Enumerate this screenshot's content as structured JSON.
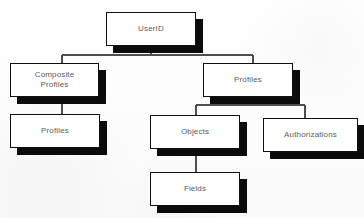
{
  "diagram": {
    "type": "tree",
    "background_color": "#fdfdfd",
    "box_fill_color": "#ffffff",
    "box_border_color": "#101010",
    "shadow_color": "#0b0b0b",
    "connector_color": "#4e4e4e",
    "label_color": "#5a5a5a",
    "nodes": [
      {
        "id": "userid",
        "label": "UserID",
        "x": 106,
        "y": 12,
        "w": 90,
        "h": 34,
        "shadow_dx": 7,
        "shadow_dy": 7
      },
      {
        "id": "composite-profiles",
        "label": "Composite\nProfiles",
        "x": 10,
        "y": 63,
        "w": 89,
        "h": 34,
        "shadow_dx": 7,
        "shadow_dy": 7
      },
      {
        "id": "profiles-left",
        "label": "Profiles",
        "x": 10,
        "y": 114,
        "w": 90,
        "h": 34,
        "shadow_dx": 7,
        "shadow_dy": 7
      },
      {
        "id": "profiles-right",
        "label": "Profiles",
        "x": 203,
        "y": 63,
        "w": 90,
        "h": 34,
        "shadow_dx": 7,
        "shadow_dy": 7
      },
      {
        "id": "objects",
        "label": "Objects",
        "x": 150,
        "y": 115,
        "w": 90,
        "h": 34,
        "shadow_dx": 7,
        "shadow_dy": 7
      },
      {
        "id": "authorizations",
        "label": "Authorizations",
        "x": 263,
        "y": 118,
        "w": 95,
        "h": 34,
        "shadow_dx": 7,
        "shadow_dy": 7
      },
      {
        "id": "fields",
        "label": "Fields",
        "x": 150,
        "y": 172,
        "w": 90,
        "h": 34,
        "shadow_dx": 7,
        "shadow_dy": 7
      }
    ],
    "edges": [
      {
        "id": "userid-stem",
        "from": "userid",
        "to": "bus-1",
        "x1": 151,
        "y1": 46,
        "x2": 151,
        "y2": 55
      },
      {
        "id": "bus-1",
        "from": "userid",
        "to": "children",
        "x1": 62,
        "y1": 55,
        "x2": 253,
        "y2": 55
      },
      {
        "id": "bus-1-left-drop",
        "from": "bus-1",
        "to": "composite-profiles",
        "x1": 62,
        "y1": 55,
        "x2": 62,
        "y2": 63
      },
      {
        "id": "bus-1-right-drop",
        "from": "bus-1",
        "to": "profiles-right",
        "x1": 253,
        "y1": 55,
        "x2": 253,
        "y2": 63
      },
      {
        "id": "composite-to-profiles",
        "from": "composite-profiles",
        "to": "profiles-left",
        "x1": 62,
        "y1": 97,
        "x2": 62,
        "y2": 114
      },
      {
        "id": "profiles-stem",
        "from": "profiles-right",
        "to": "bus-2",
        "x1": 249,
        "y1": 97,
        "x2": 249,
        "y2": 105
      },
      {
        "id": "bus-2",
        "from": "profiles-right",
        "to": "children",
        "x1": 196,
        "y1": 105,
        "x2": 305,
        "y2": 105
      },
      {
        "id": "bus-2-left-drop",
        "from": "bus-2",
        "to": "objects",
        "x1": 196,
        "y1": 105,
        "x2": 196,
        "y2": 115
      },
      {
        "id": "bus-2-right-drop",
        "from": "bus-2",
        "to": "authorizations",
        "x1": 305,
        "y1": 105,
        "x2": 305,
        "y2": 118
      },
      {
        "id": "objects-to-fields",
        "from": "objects",
        "to": "fields",
        "x1": 196,
        "y1": 149,
        "x2": 196,
        "y2": 172
      }
    ]
  }
}
